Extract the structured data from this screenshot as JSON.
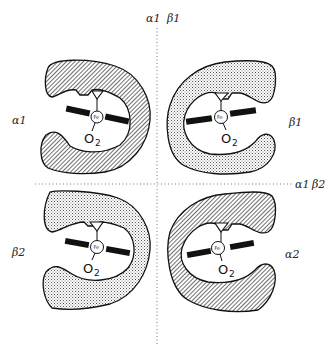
{
  "figure": {
    "axis_labels": {
      "vertical_top": {
        "a": "α1",
        "b": "β1"
      },
      "horizontal_right": {
        "a": "α1",
        "b": "β2"
      }
    },
    "subunits": [
      {
        "id": "top-left",
        "label": "α1",
        "chain": "alpha",
        "fill": "hatched",
        "iron": "Fe",
        "ligand_main": "O",
        "ligand_sub": "2"
      },
      {
        "id": "top-right",
        "label": "β1",
        "chain": "beta",
        "fill": "stippled",
        "iron": "Fe",
        "ligand_main": "O",
        "ligand_sub": "2"
      },
      {
        "id": "bottom-left",
        "label": "β2",
        "chain": "beta",
        "fill": "stippled",
        "iron": "Fe",
        "ligand_main": "O",
        "ligand_sub": "2"
      },
      {
        "id": "bottom-right",
        "label": "α2",
        "chain": "alpha",
        "fill": "hatched",
        "iron": "Fe",
        "ligand_main": "O",
        "ligand_sub": "2"
      }
    ],
    "colors": {
      "ink": "#1a1a1a",
      "background": "#ffffff"
    }
  }
}
